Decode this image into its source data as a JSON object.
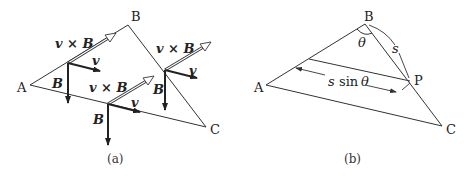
{
  "panel_a": {
    "caption": "(a)",
    "vertices": {
      "A": "A",
      "B": "B",
      "C": "C"
    },
    "vector_labels": {
      "v_cross_B": "v × B",
      "v": "v",
      "B": "B"
    },
    "groups": [
      {
        "name": "left",
        "vxb": "v × B",
        "v": "v",
        "B": "B"
      },
      {
        "name": "middle",
        "vxb": "v × B",
        "v": "v",
        "B": "B"
      },
      {
        "name": "right",
        "vxb": "v × B",
        "v": "v",
        "B": "B"
      }
    ]
  },
  "panel_b": {
    "caption": "(b)",
    "vertices": {
      "A": "A",
      "B": "B",
      "C": "C",
      "P": "P"
    },
    "angle_label": "θ",
    "arc_label": "s",
    "distance_label_s": "s",
    "distance_label_sin": "sin",
    "distance_label_theta": "θ"
  }
}
